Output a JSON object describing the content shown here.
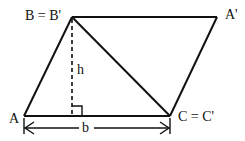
{
  "diagram": {
    "type": "parallelogram-area-proof",
    "stroke_color": "#111111",
    "background_color": "#ffffff",
    "vertices": {
      "A": {
        "label": "A",
        "x": 24,
        "y": 116
      },
      "B": {
        "label": "B = B'",
        "x": 72,
        "y": 17
      },
      "A_prime": {
        "label": "A'",
        "x": 217,
        "y": 17
      },
      "C": {
        "label": "C = C'",
        "x": 170,
        "y": 116
      }
    },
    "labels": {
      "b_vertex": "B = B'",
      "a_prime_vertex": "A'",
      "a_vertex": "A",
      "c_vertex": "C = C'",
      "height": "h",
      "base": "b"
    },
    "edges": [
      {
        "name": "edge-A-B",
        "from": "A",
        "to": "B",
        "style": "solid"
      },
      {
        "name": "edge-B-Aprime",
        "from": "B",
        "to": "A_prime",
        "style": "solid"
      },
      {
        "name": "edge-Aprime-C",
        "from": "A_prime",
        "to": "C",
        "style": "solid"
      },
      {
        "name": "edge-A-C",
        "from": "A",
        "to": "C",
        "style": "solid"
      },
      {
        "name": "diagonal-B-C",
        "from": "B",
        "to": "C",
        "style": "solid"
      }
    ],
    "altitude": {
      "from": "B",
      "foot_x": 72,
      "foot_y": 116,
      "style": "dashed",
      "label": "h"
    },
    "base_dimension": {
      "from_x": 24,
      "to_x": 170,
      "y": 128,
      "label": "b",
      "arrows": "both"
    }
  }
}
